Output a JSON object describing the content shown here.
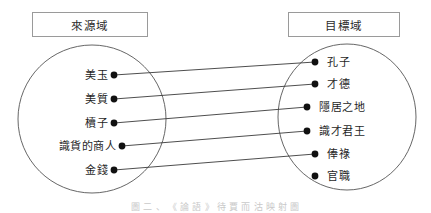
{
  "figure": {
    "caption": "圖 二 、 《 論 語 》 待 賈 而 沽 映 射 圖",
    "stroke_color": "#3a3a3a",
    "box_border_color": "#9a9a9a",
    "dot_color": "#111111"
  },
  "source_domain": {
    "title": "來源域",
    "items": [
      {
        "label": "美玉",
        "dot_x": 114,
        "dot_y": 75,
        "label_x": 108,
        "label_y": 75
      },
      {
        "label": "美質",
        "dot_x": 114,
        "dot_y": 99,
        "label_x": 108,
        "label_y": 99
      },
      {
        "label": "櫝子",
        "dot_x": 114,
        "dot_y": 123,
        "label_x": 108,
        "label_y": 123
      },
      {
        "label": "識貨的商人",
        "dot_x": 122,
        "dot_y": 146,
        "label_x": 116,
        "label_y": 146
      },
      {
        "label": "金錢",
        "dot_x": 114,
        "dot_y": 170,
        "label_x": 108,
        "label_y": 170
      }
    ],
    "ellipse": {
      "cx": 92,
      "cy": 119,
      "rx": 74,
      "ry": 74
    }
  },
  "target_domain": {
    "title": "目標域",
    "items": [
      {
        "label": "孔子",
        "dot_x": 315,
        "dot_y": 62,
        "label_x": 327,
        "label_y": 62
      },
      {
        "label": "才德",
        "dot_x": 315,
        "dot_y": 84,
        "label_x": 327,
        "label_y": 84
      },
      {
        "label": "隱居之地",
        "dot_x": 307,
        "dot_y": 107,
        "label_x": 319,
        "label_y": 107
      },
      {
        "label": "識才君王",
        "dot_x": 307,
        "dot_y": 131,
        "label_x": 319,
        "label_y": 131
      },
      {
        "label": "俸祿",
        "dot_x": 315,
        "dot_y": 154,
        "label_x": 327,
        "label_y": 154
      },
      {
        "label": "官職",
        "dot_x": 315,
        "dot_y": 176,
        "label_x": 327,
        "label_y": 176
      }
    ],
    "ellipse": {
      "cx": 347,
      "cy": 117,
      "rx": 69,
      "ry": 73
    }
  },
  "mappings": [
    {
      "from": "美玉",
      "to": "孔子",
      "x1": 114,
      "y1": 75,
      "x2": 315,
      "y2": 62
    },
    {
      "from": "美質",
      "to": "才德",
      "x1": 114,
      "y1": 99,
      "x2": 315,
      "y2": 84
    },
    {
      "from": "櫝子",
      "to": "隱居之地",
      "x1": 114,
      "y1": 123,
      "x2": 307,
      "y2": 107
    },
    {
      "from": "識貨的商人",
      "to": "識才君王",
      "x1": 122,
      "y1": 146,
      "x2": 307,
      "y2": 131
    },
    {
      "from": "金錢",
      "to": "俸祿",
      "x1": 114,
      "y1": 170,
      "x2": 315,
      "y2": 154
    }
  ]
}
